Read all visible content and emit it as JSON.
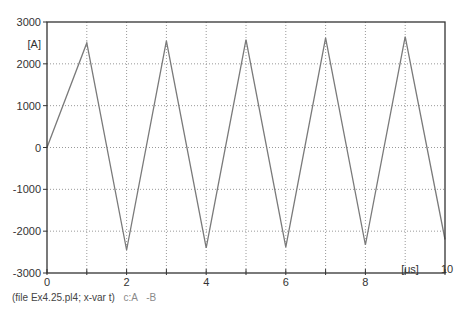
{
  "chart_data": {
    "type": "line",
    "title": "",
    "xlabel": "[us]",
    "ylabel": "[A]",
    "xlim": [
      0,
      10
    ],
    "ylim": [
      -3000,
      3000
    ],
    "x_ticks": [
      0,
      2,
      4,
      6,
      8,
      10
    ],
    "x_tick_labels": [
      "0",
      "2",
      "4",
      "6",
      "8",
      "10"
    ],
    "x_minor_ticks": [
      1,
      3,
      5,
      7,
      9
    ],
    "y_ticks": [
      3000,
      2000,
      1000,
      0,
      -1000,
      -2000,
      -3000
    ],
    "y_tick_labels": [
      "3000",
      "2000",
      "1000",
      "0",
      "-1000",
      "-2000",
      "-3000"
    ],
    "grid": true,
    "grid_style": "dotted",
    "series": [
      {
        "name": "c:A -B",
        "color": "#7a7a7a",
        "x": [
          0,
          1,
          2,
          3,
          4,
          5,
          6,
          7,
          8,
          9,
          10
        ],
        "values": [
          0,
          2500,
          -2450,
          2550,
          -2400,
          2580,
          -2380,
          2620,
          -2330,
          2650,
          -2200
        ]
      }
    ]
  },
  "caption": {
    "file_text": "(file Ex4.25.pl4; x-var t)",
    "legend_label": "c:A",
    "legend_suffix": "-B"
  },
  "colors": {
    "axis": "#333333",
    "grid": "#999999",
    "trace": "#7a7a7a"
  }
}
